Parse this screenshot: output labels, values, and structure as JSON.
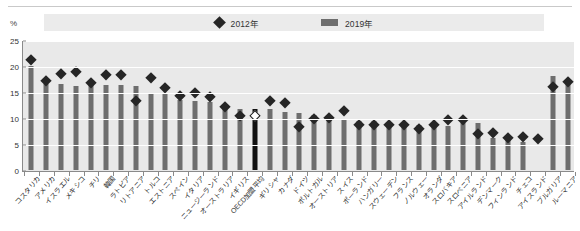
{
  "legend": {
    "entries": [
      {
        "label": "2012年",
        "marker": "diamond-icon",
        "color": "#262626"
      },
      {
        "label": "2019年",
        "marker": "bar-swatch-icon",
        "color": "#6e6e6e"
      }
    ]
  },
  "axis": {
    "unit_label": "%",
    "y_ticks": [
      "0",
      "5",
      "10",
      "15",
      "20",
      "25"
    ]
  },
  "colors": {
    "bar": "#6e6e6e",
    "bar_highlight": "#111111",
    "marker": "#262626",
    "plot_background": "#e9e9e9",
    "gridline": "#ffffff",
    "axis": "#8a8a8a"
  },
  "chart_data": {
    "type": "bar",
    "title": "",
    "subtitle": "",
    "xlabel": "",
    "ylabel": "%",
    "ylim": [
      0,
      25
    ],
    "ytick_step": 5,
    "grid": true,
    "legend_position": "top-center",
    "highlight_category": "OECD加盟平均",
    "categories": [
      "コスタリカ",
      "アメリカ",
      "イスラエル",
      "メキシコ",
      "チリ",
      "韓国",
      "ラトビア",
      "リトアニア",
      "トルコ",
      "エストニア",
      "スペイン",
      "イタリア",
      "ニュージーランド",
      "オーストラリア",
      "イギリス",
      "OECD加盟平均",
      "ギリシャ",
      "カナダ",
      "ドイツ",
      "ポルトガル",
      "オーストリア",
      "スイス",
      "ポーランド",
      "ハンガリー",
      "スウェーデン",
      "フランス",
      "ノルウェー",
      "オランダ",
      "スロバキア",
      "スロベニア",
      "アイルランド",
      "デンマーク",
      "フィンランド",
      "チェコ",
      "アイスランド",
      "ブルガリア",
      "ルーマニア"
    ],
    "series": [
      {
        "name": "2012年",
        "type": "scatter",
        "marker": "diamond",
        "values": [
          21.3,
          17.3,
          18.5,
          19.0,
          16.8,
          18.4,
          18.4,
          13.4,
          17.8,
          15.9,
          14.3,
          15.0,
          14.1,
          12.3,
          10.4,
          10.4,
          13.3,
          12.9,
          8.4,
          10.0,
          10.1,
          11.5,
          8.8,
          8.8,
          8.8,
          8.8,
          8.0,
          8.8,
          9.8,
          9.8,
          7.0,
          7.3,
          6.3,
          6.4,
          6.0,
          16.1,
          17.0
        ]
      },
      {
        "name": "2019年",
        "type": "bar",
        "values": [
          20.0,
          16.5,
          16.5,
          16.1,
          16.5,
          16.3,
          16.3,
          16.2,
          14.8,
          14.9,
          13.5,
          13.3,
          13.1,
          12.6,
          11.8,
          11.7,
          11.7,
          11.2,
          10.9,
          10.6,
          10.2,
          9.7,
          9.4,
          9.4,
          9.1,
          9.1,
          8.7,
          8.5,
          8.4,
          9.0,
          9.0,
          6.1,
          6.0,
          5.4,
          null,
          18.0,
          17.0
        ]
      }
    ]
  }
}
